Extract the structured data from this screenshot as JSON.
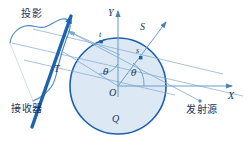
{
  "figure": {
    "domain": "diagram",
    "width": 247,
    "height": 147,
    "background": "#ffffff"
  },
  "colors": {
    "circle_fill": "#dce9f5",
    "circle_stroke": "#1a5fb4",
    "ray_line": "#7fa8cf",
    "axis": "#5b8fc4",
    "detector_bar": "#1c63b0",
    "profile_curve": "#4a86c8",
    "text": "#16345c"
  },
  "labels": {
    "projection": "投影",
    "receiver": "接收器",
    "source": "发射源",
    "object": "Q",
    "detector_axis": "T",
    "s_axis": "S",
    "s_point": "s",
    "t_point": "t",
    "x_axis": "X",
    "y_axis": "Y",
    "origin": "O",
    "angle_left": "θ",
    "angle_right": "θ"
  },
  "geometry": {
    "circle": {
      "cx": 118,
      "cy": 86,
      "r": 48
    },
    "origin": {
      "x": 118,
      "y": 86
    },
    "x_axis": {
      "x1": 118,
      "y1": 86,
      "x2": 238,
      "y2": 86
    },
    "y_axis": {
      "x1": 118,
      "y1": 95,
      "x2": 118,
      "y2": 9
    },
    "s_axis": {
      "x1": 118,
      "y1": 86,
      "x2": 168,
      "y2": 20
    },
    "t_axis": {
      "x1": 118,
      "y1": 86,
      "x2": 62,
      "y2": 52
    },
    "theta_left_deg": 54,
    "theta_right_deg": 53,
    "s_point": {
      "x": 141,
      "y": 55
    },
    "t_point": {
      "x": 103,
      "y": 44
    },
    "source_point": {
      "x": 200,
      "y": 101
    },
    "detector_bar": {
      "x1": 31,
      "y1": 126,
      "x2": 72,
      "y2": 14
    },
    "n_rays": 4
  }
}
